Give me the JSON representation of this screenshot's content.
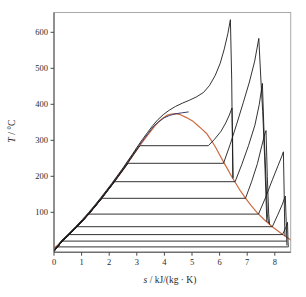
{
  "chart_data": {
    "type": "line",
    "title": "",
    "xlabel": "s / kJ/(kg · K)",
    "ylabel": "T / °C",
    "xlim": [
      0,
      8.6
    ],
    "ylim": [
      -10,
      655
    ],
    "grid": false,
    "legend": "none",
    "axes": {
      "x_label_var": "s",
      "x_label_rest": " / kJ/(kg · K)",
      "y_label_var": "T",
      "y_label_rest": " / °C",
      "x_ticks": [
        0,
        1,
        2,
        3,
        4,
        5,
        6,
        7,
        8
      ],
      "y_ticks": [
        100,
        200,
        300,
        400,
        500,
        600
      ]
    },
    "colors": {
      "saturation": "#cc6a40",
      "critical_isobar": "#3d3d6b",
      "isobar": "#1c1c1c",
      "frame": "#a9a9a9",
      "axis": "#4a4a4a"
    },
    "isobar_saturation_temperatures_c": [
      285,
      236,
      185,
      139,
      95,
      60,
      38,
      20,
      4
    ],
    "peaks_s_T": [
      [
        6.39,
        635
      ],
      [
        6.45,
        390
      ],
      [
        7.42,
        583
      ],
      [
        7.55,
        458
      ],
      [
        7.68,
        327
      ],
      [
        8.31,
        268
      ],
      [
        8.38,
        145
      ],
      [
        8.46,
        72
      ]
    ],
    "critical_point_s_T": [
      4.41,
      374
    ],
    "series": [
      {
        "name": "saturation-dome",
        "color_key": "saturation",
        "width": 1.2,
        "points": [
          [
            0,
            0
          ],
          [
            0.3,
            20
          ],
          [
            0.57,
            40
          ],
          [
            0.83,
            60
          ],
          [
            1.08,
            80
          ],
          [
            1.31,
            100
          ],
          [
            1.53,
            120
          ],
          [
            1.74,
            140
          ],
          [
            1.94,
            160
          ],
          [
            2.14,
            180
          ],
          [
            2.33,
            200
          ],
          [
            2.52,
            220
          ],
          [
            2.7,
            240
          ],
          [
            2.88,
            260
          ],
          [
            3.06,
            280
          ],
          [
            3.25,
            300
          ],
          [
            3.45,
            320
          ],
          [
            3.66,
            340
          ],
          [
            3.78,
            350
          ],
          [
            3.92,
            360
          ],
          [
            4.11,
            370
          ],
          [
            4.25,
            373
          ],
          [
            4.41,
            374
          ],
          [
            4.58,
            371
          ],
          [
            4.8,
            363
          ],
          [
            5.05,
            352
          ],
          [
            5.21,
            341
          ],
          [
            5.36,
            331
          ],
          [
            5.54,
            318
          ],
          [
            5.7,
            300
          ],
          [
            5.86,
            280
          ],
          [
            6.0,
            260
          ],
          [
            6.14,
            240
          ],
          [
            6.29,
            220
          ],
          [
            6.43,
            200
          ],
          [
            6.59,
            180
          ],
          [
            6.75,
            160
          ],
          [
            6.93,
            140
          ],
          [
            7.13,
            120
          ],
          [
            7.35,
            100
          ],
          [
            7.61,
            80
          ],
          [
            7.91,
            60
          ],
          [
            8.26,
            40
          ],
          [
            8.45,
            30
          ],
          [
            8.6,
            22
          ]
        ]
      },
      {
        "name": "critical-isobar",
        "color_key": "critical_isobar",
        "width": 1.0,
        "points": [
          [
            0,
            -8
          ],
          [
            0.27,
            20
          ],
          [
            0.54,
            40
          ],
          [
            0.8,
            60
          ],
          [
            1.05,
            80
          ],
          [
            1.28,
            100
          ],
          [
            1.5,
            120
          ],
          [
            1.71,
            140
          ],
          [
            1.91,
            160
          ],
          [
            2.11,
            180
          ],
          [
            2.3,
            200
          ],
          [
            2.49,
            220
          ],
          [
            2.67,
            240
          ],
          [
            2.85,
            260
          ],
          [
            3.03,
            280
          ],
          [
            3.22,
            300
          ],
          [
            3.42,
            320
          ],
          [
            3.62,
            340
          ],
          [
            3.8,
            352
          ],
          [
            3.98,
            362
          ],
          [
            4.18,
            369
          ],
          [
            4.42,
            374
          ],
          [
            4.62,
            376
          ],
          [
            4.88,
            379
          ]
        ]
      },
      {
        "name": "isobar-supercritical",
        "color_key": "isobar",
        "width": 0.9,
        "points": [
          [
            0,
            -8
          ],
          [
            0.25,
            20
          ],
          [
            0.52,
            40
          ],
          [
            0.78,
            60
          ],
          [
            1.03,
            80
          ],
          [
            1.26,
            100
          ],
          [
            1.48,
            120
          ],
          [
            1.69,
            140
          ],
          [
            1.89,
            160
          ],
          [
            2.09,
            180
          ],
          [
            2.28,
            200
          ],
          [
            2.47,
            220
          ],
          [
            2.65,
            240
          ],
          [
            2.83,
            260
          ],
          [
            3.01,
            281
          ],
          [
            3.2,
            302
          ],
          [
            3.39,
            322
          ],
          [
            3.58,
            341
          ],
          [
            3.77,
            358
          ],
          [
            3.97,
            372
          ],
          [
            4.18,
            384
          ],
          [
            4.4,
            394
          ],
          [
            4.65,
            403
          ],
          [
            4.9,
            411
          ],
          [
            5.15,
            420
          ],
          [
            5.42,
            433
          ],
          [
            5.63,
            452
          ],
          [
            5.84,
            480
          ],
          [
            6.02,
            514
          ],
          [
            6.17,
            554
          ],
          [
            6.3,
            597
          ],
          [
            6.39,
            635
          ],
          [
            6.44,
            470
          ],
          [
            6.45,
            392
          ],
          [
            6.48,
            196
          ]
        ]
      },
      {
        "name": "isobar-285C",
        "color_key": "isobar",
        "width": 0.9,
        "points": [
          [
            0,
            -8
          ],
          [
            0.3,
            20
          ],
          [
            0.57,
            40
          ],
          [
            0.83,
            60
          ],
          [
            1.08,
            80
          ],
          [
            1.31,
            100
          ],
          [
            1.53,
            120
          ],
          [
            1.74,
            140
          ],
          [
            1.94,
            160
          ],
          [
            2.14,
            180
          ],
          [
            2.33,
            200
          ],
          [
            2.52,
            220
          ],
          [
            2.7,
            240
          ],
          [
            2.88,
            260
          ],
          [
            3.06,
            280
          ],
          [
            3.13,
            285
          ],
          [
            5.59,
            285
          ],
          [
            5.82,
            303
          ],
          [
            6.05,
            325
          ],
          [
            6.22,
            348
          ],
          [
            6.35,
            370
          ],
          [
            6.45,
            390
          ],
          [
            6.47,
            300
          ],
          [
            6.49,
            194
          ]
        ]
      },
      {
        "name": "isobar-236C",
        "color_key": "isobar",
        "width": 0.9,
        "points": [
          [
            0,
            -8
          ],
          [
            0.3,
            20
          ],
          [
            0.57,
            40
          ],
          [
            0.83,
            60
          ],
          [
            1.08,
            80
          ],
          [
            1.31,
            100
          ],
          [
            1.53,
            120
          ],
          [
            1.74,
            140
          ],
          [
            1.94,
            160
          ],
          [
            2.14,
            180
          ],
          [
            2.33,
            200
          ],
          [
            2.52,
            220
          ],
          [
            2.69,
            236
          ],
          [
            6.14,
            236
          ],
          [
            6.38,
            288
          ],
          [
            6.62,
            345
          ],
          [
            6.86,
            405
          ],
          [
            7.08,
            462
          ],
          [
            7.27,
            520
          ],
          [
            7.42,
            583
          ],
          [
            7.5,
            462
          ],
          [
            7.56,
            380
          ],
          [
            7.63,
            255
          ],
          [
            7.68,
            140
          ],
          [
            7.71,
            74
          ]
        ]
      },
      {
        "name": "isobar-185C",
        "color_key": "isobar",
        "width": 0.9,
        "points": [
          [
            0,
            -8
          ],
          [
            0.3,
            20
          ],
          [
            0.57,
            40
          ],
          [
            0.83,
            60
          ],
          [
            1.08,
            80
          ],
          [
            1.31,
            100
          ],
          [
            1.53,
            120
          ],
          [
            1.74,
            140
          ],
          [
            1.94,
            160
          ],
          [
            2.14,
            180
          ],
          [
            2.16,
            185
          ],
          [
            6.56,
            185
          ],
          [
            6.8,
            232
          ],
          [
            7.05,
            286
          ],
          [
            7.28,
            342
          ],
          [
            7.44,
            400
          ],
          [
            7.55,
            458
          ],
          [
            7.6,
            340
          ],
          [
            7.68,
            190
          ],
          [
            7.73,
            95
          ],
          [
            7.77,
            70
          ]
        ]
      },
      {
        "name": "isobar-139C",
        "color_key": "isobar",
        "width": 0.9,
        "points": [
          [
            0,
            -8
          ],
          [
            0.3,
            20
          ],
          [
            0.57,
            40
          ],
          [
            0.83,
            60
          ],
          [
            1.08,
            80
          ],
          [
            1.31,
            100
          ],
          [
            1.53,
            120
          ],
          [
            1.73,
            138
          ],
          [
            1.74,
            139
          ],
          [
            6.94,
            139
          ],
          [
            7.16,
            185
          ],
          [
            7.37,
            235
          ],
          [
            7.53,
            285
          ],
          [
            7.64,
            318
          ],
          [
            7.68,
            327
          ],
          [
            7.73,
            200
          ],
          [
            7.78,
            95
          ],
          [
            7.81,
            66
          ]
        ]
      },
      {
        "name": "isobar-95C",
        "color_key": "isobar",
        "width": 0.9,
        "points": [
          [
            0,
            -8
          ],
          [
            0.3,
            20
          ],
          [
            0.57,
            40
          ],
          [
            0.83,
            60
          ],
          [
            1.08,
            80
          ],
          [
            1.25,
            94
          ],
          [
            1.26,
            95
          ],
          [
            7.41,
            95
          ],
          [
            7.66,
            140
          ],
          [
            7.92,
            192
          ],
          [
            8.12,
            230
          ],
          [
            8.26,
            257
          ],
          [
            8.31,
            268
          ],
          [
            8.34,
            150
          ],
          [
            8.36,
            60
          ],
          [
            8.37,
            34
          ]
        ]
      },
      {
        "name": "isobar-60C",
        "color_key": "isobar",
        "width": 0.9,
        "points": [
          [
            0,
            -8
          ],
          [
            0.3,
            20
          ],
          [
            0.57,
            40
          ],
          [
            0.82,
            59
          ],
          [
            0.83,
            60
          ],
          [
            7.91,
            60
          ],
          [
            8.1,
            92
          ],
          [
            8.27,
            122
          ],
          [
            8.38,
            145
          ],
          [
            8.42,
            60
          ],
          [
            8.44,
            8
          ]
        ]
      },
      {
        "name": "isobar-38C",
        "color_key": "isobar",
        "width": 0.9,
        "points": [
          [
            0,
            -8
          ],
          [
            0.3,
            20
          ],
          [
            0.55,
            37
          ],
          [
            0.56,
            38
          ],
          [
            8.28,
            38
          ],
          [
            8.4,
            58
          ],
          [
            8.46,
            72
          ],
          [
            8.48,
            20
          ],
          [
            8.49,
            3
          ]
        ]
      },
      {
        "name": "isobar-20C",
        "color_key": "isobar",
        "width": 0.9,
        "points": [
          [
            0,
            -8
          ],
          [
            0.2,
            10
          ],
          [
            0.29,
            19
          ],
          [
            0.3,
            20
          ],
          [
            8.43,
            20
          ]
        ]
      },
      {
        "name": "isobar-4C",
        "color_key": "isobar",
        "width": 0.9,
        "points": [
          [
            0,
            -8
          ],
          [
            0.06,
            2
          ],
          [
            0.07,
            4
          ],
          [
            8.47,
            4
          ]
        ]
      }
    ]
  }
}
